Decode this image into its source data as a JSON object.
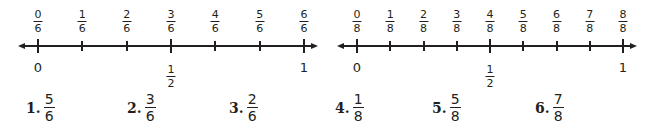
{
  "number_lines": [
    {
      "denominator": "6",
      "tick_labels": [
        {
          "num": "0",
          "den": "6"
        },
        {
          "num": "1",
          "den": "6"
        },
        {
          "num": "2",
          "den": "6"
        },
        {
          "num": "3",
          "den": "6"
        },
        {
          "num": "4",
          "den": "6"
        },
        {
          "num": "5",
          "den": "6"
        },
        {
          "num": "6",
          "den": "6"
        }
      ],
      "benchmarks": {
        "zero": "0",
        "half_num": "1",
        "half_den": "2",
        "one": "1"
      }
    },
    {
      "denominator": "8",
      "tick_labels": [
        {
          "num": "0",
          "den": "8"
        },
        {
          "num": "1",
          "den": "8"
        },
        {
          "num": "2",
          "den": "8"
        },
        {
          "num": "3",
          "den": "8"
        },
        {
          "num": "4",
          "den": "8"
        },
        {
          "num": "5",
          "den": "8"
        },
        {
          "num": "6",
          "den": "8"
        },
        {
          "num": "7",
          "den": "8"
        },
        {
          "num": "8",
          "den": "8"
        }
      ],
      "benchmarks": {
        "zero": "0",
        "half_num": "1",
        "half_den": "2",
        "one": "1"
      }
    }
  ],
  "problems": [
    {
      "label": "1.",
      "num": "5",
      "den": "6"
    },
    {
      "label": "2.",
      "num": "3",
      "den": "6"
    },
    {
      "label": "3.",
      "num": "2",
      "den": "6"
    },
    {
      "label": "4.",
      "num": "1",
      "den": "8"
    },
    {
      "label": "5.",
      "num": "5",
      "den": "8"
    },
    {
      "label": "6.",
      "num": "7",
      "den": "8"
    }
  ],
  "colors": {
    "ink": "#231f20",
    "background": "#ffffff"
  }
}
